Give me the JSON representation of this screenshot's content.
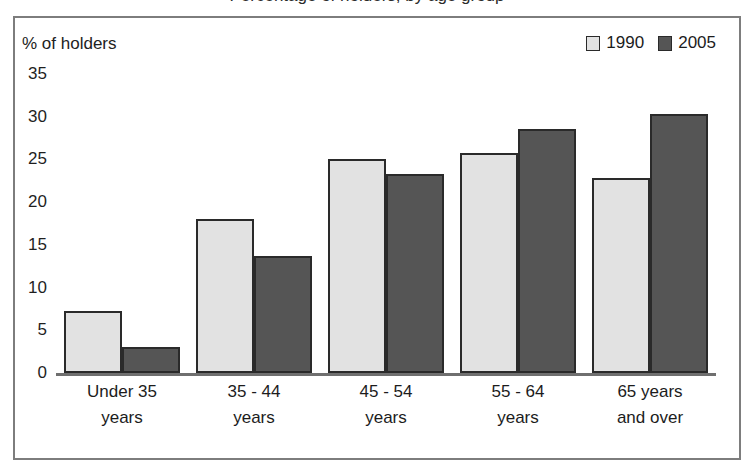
{
  "title": {
    "text": "Percentage of holders, by age group"
  },
  "axis_caption": "% of holders",
  "legend": {
    "entries": [
      {
        "label": "1990",
        "color": "#e2e2e2"
      },
      {
        "label": "2005",
        "color": "#555555"
      }
    ]
  },
  "colors": {
    "series_1990": "#e2e2e2",
    "series_2005": "#555555",
    "bar_outline": "#2a2a2a",
    "frame": "#7d7d7d",
    "axis": "#6f6f6f",
    "text": "#1c1c1c",
    "background": "#ffffff"
  },
  "chart_data": {
    "type": "bar",
    "title": "Percentage of holders, by age group",
    "xlabel": "",
    "ylabel": "% of holders",
    "ylim": [
      0,
      35
    ],
    "yticks": [
      0,
      5,
      10,
      15,
      20,
      25,
      30,
      35
    ],
    "ytick_labels": [
      "0",
      "5",
      "10",
      "15",
      "20",
      "25",
      "30",
      "35"
    ],
    "grid": false,
    "legend_position": "top-right",
    "categories": [
      "Under 35 years",
      "35 - 44 years",
      "45 - 54 years",
      "55 - 64 years",
      "65 years and over"
    ],
    "category_lines": [
      [
        "Under 35",
        "years"
      ],
      [
        "35 - 44",
        "years"
      ],
      [
        "45 - 54",
        "years"
      ],
      [
        "55 - 64",
        "years"
      ],
      [
        "65 years",
        "and over"
      ]
    ],
    "series": [
      {
        "name": "1990",
        "color": "#e2e2e2",
        "values": [
          7.3,
          18.0,
          25.1,
          25.7,
          22.8
        ]
      },
      {
        "name": "2005",
        "color": "#555555",
        "values": [
          3.0,
          13.7,
          23.3,
          28.6,
          30.3
        ]
      }
    ]
  }
}
